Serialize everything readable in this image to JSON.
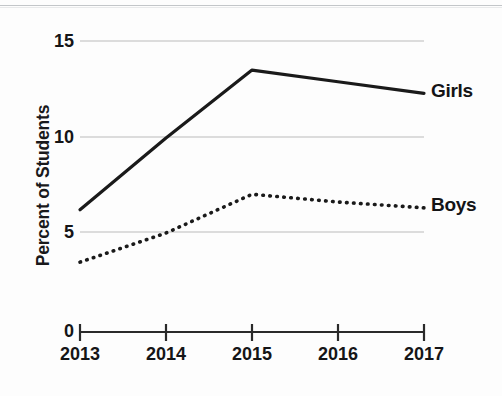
{
  "chart_data": {
    "type": "line",
    "title": "",
    "xlabel": "",
    "ylabel": "Percent of Students",
    "x": [
      2013,
      2014,
      2015,
      2016,
      2017
    ],
    "xtick_labels": [
      "2013",
      "2014",
      "2015",
      "2016",
      "2017"
    ],
    "ytick_labels": [
      "0",
      "5",
      "10",
      "15"
    ],
    "yticks": [
      0,
      5,
      10,
      15
    ],
    "ylim": [
      0,
      15
    ],
    "xlim": [
      2013,
      2017
    ],
    "grid": "horizontal gridlines at 5, 10, 15 (light gray); solid x-axis rule at 0",
    "legend": "inline end-of-line labels at right",
    "series": [
      {
        "name": "Girls",
        "style": "solid",
        "color": "#1a1a1a",
        "values": [
          6.3,
          10.0,
          13.5,
          12.9,
          12.3
        ]
      },
      {
        "name": "Boys",
        "style": "dotted",
        "color": "#1a1a1a",
        "values": [
          3.6,
          5.1,
          7.1,
          6.7,
          6.4
        ]
      }
    ]
  },
  "axis": {
    "ylabel": "Percent of Students",
    "y_ticks": [
      {
        "label": "15",
        "value": 15
      },
      {
        "label": "10",
        "value": 10
      },
      {
        "label": "5",
        "value": 5
      },
      {
        "label": "0",
        "value": 0
      }
    ],
    "x_ticks": [
      {
        "label": "2013",
        "value": 2013
      },
      {
        "label": "2014",
        "value": 2014
      },
      {
        "label": "2015",
        "value": 2015
      },
      {
        "label": "2016",
        "value": 2016
      },
      {
        "label": "2017",
        "value": 2017
      }
    ]
  },
  "series_labels": {
    "girls": "Girls",
    "boys": "Boys"
  },
  "colors": {
    "ink": "#141416",
    "gridline": "#dcdcdc",
    "axis_rule": "#2a2a2a",
    "background": "#fdfdfd"
  }
}
